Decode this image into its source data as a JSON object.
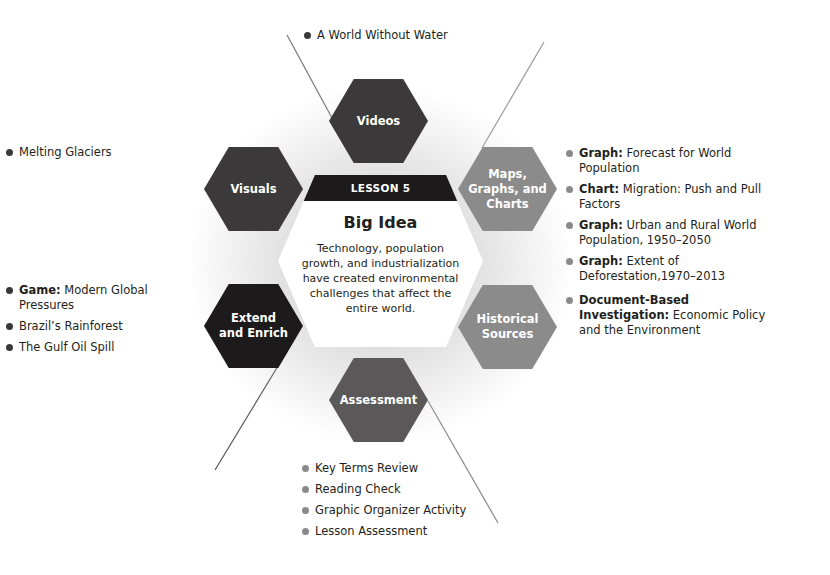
{
  "colors": {
    "videos": "#3b393a",
    "visuals": "#3b393a",
    "maps": "#8b8b8b",
    "extend": "#1c1a1b",
    "historical": "#8b8b8b",
    "assessment": "#5a5859",
    "band": "#1c1a1b",
    "bullet_dark": "#3a3839",
    "bullet_gray": "#8a8a8a"
  },
  "center": {
    "band_label": "LESSON 5",
    "title": "Big Idea",
    "text": "Technology, population growth, and industrialization have created environmental challenges that affect the entire world."
  },
  "hexagons": {
    "videos": "Videos",
    "visuals": "Visuals",
    "maps": "Maps,\nGraphs, and\nCharts",
    "extend": "Extend\nand Enrich",
    "historical": "Historical\nSources",
    "assessment": "Assessment"
  },
  "lists": {
    "videos": [
      {
        "bold": "",
        "text": "A World Without Water"
      }
    ],
    "visuals": [
      {
        "bold": "",
        "text": "Melting Glaciers"
      }
    ],
    "maps": [
      {
        "bold": "Graph:",
        "text": " Forecast for World Population"
      },
      {
        "bold": "Chart:",
        "text": " Migration: Push and Pull Factors"
      },
      {
        "bold": "Graph:",
        "text": " Urban and Rural World Population, 1950–2050"
      },
      {
        "bold": "Graph:",
        "text": " Extent of Deforestation,1970–2013"
      }
    ],
    "extend": [
      {
        "bold": "Game:",
        "text": " Modern Global Pressures"
      },
      {
        "bold": "",
        "text": "Brazil’s Rainforest"
      },
      {
        "bold": "",
        "text": "The Gulf Oil Spill"
      }
    ],
    "historical": [
      {
        "bold": "Document-Based Investigation:",
        "text": " Economic Policy and the Environment"
      }
    ],
    "assessment": [
      {
        "bold": "",
        "text": "Key Terms Review"
      },
      {
        "bold": "",
        "text": "Reading Check"
      },
      {
        "bold": "",
        "text": "Graphic Organizer Activity"
      },
      {
        "bold": "",
        "text": "Lesson Assessment"
      }
    ]
  }
}
